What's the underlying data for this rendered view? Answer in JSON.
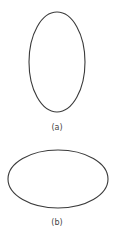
{
  "figure": {
    "stroke_color": "#3a3a3a",
    "panels": [
      {
        "label": "(a)",
        "shape": "vertical-ellipse",
        "cx": 57,
        "cy": 62,
        "rx": 28,
        "ry": 50
      },
      {
        "label": "(b)",
        "shape": "horizontal-ellipse",
        "cx": 58,
        "cy": 179,
        "rx": 50,
        "ry": 29
      }
    ]
  }
}
